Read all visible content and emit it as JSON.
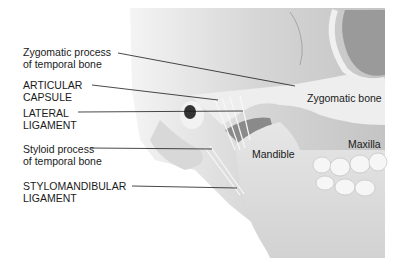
{
  "diagram": {
    "callouts": [
      {
        "line1": "Zygomatic process",
        "line2": "of temporal bone"
      },
      {
        "line1": "ARTICULAR",
        "line2": "CAPSULE"
      },
      {
        "line1": "LATERAL",
        "line2": "LIGAMENT"
      },
      {
        "line1": "Styloid process",
        "line2": "of temporal bone"
      },
      {
        "line1": "STYLOMANDIBULAR",
        "line2": "LIGAMENT"
      }
    ],
    "inline_labels": {
      "zygomatic_bone": "Zygomatic bone",
      "maxilla": "Maxilla",
      "mandible": "Mandible"
    },
    "colors": {
      "background": "#ffffff",
      "skull_light": "#e8e8e8",
      "skull_mid": "#c9c9c9",
      "skull_dark": "#8a8a8a",
      "leader_line": "#1a1a1a",
      "text": "#1a1a1a"
    }
  }
}
